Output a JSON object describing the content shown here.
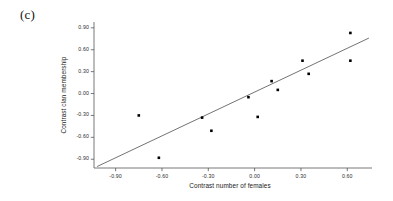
{
  "panel": {
    "label": "(c)"
  },
  "chart_data": {
    "type": "scatter",
    "title": "",
    "subtitle": "",
    "xlabel": "Contrast number of females",
    "ylabel": "Contrast clan membership",
    "xlim": [
      -1.04,
      0.76
    ],
    "ylim": [
      -1.02,
      0.98
    ],
    "xticks": [
      -0.9,
      -0.6,
      -0.3,
      0.0,
      0.3,
      0.6
    ],
    "xticklabels": [
      "-0.90",
      "-0.60",
      "-0.30",
      "0.00",
      "0.30",
      "0.60"
    ],
    "yticks": [
      -0.9,
      -0.6,
      -0.3,
      0.0,
      0.3,
      0.6,
      0.9
    ],
    "yticklabels": [
      "-0.90",
      "-0.60",
      "-0.30",
      "0.00",
      "0.30",
      "0.60",
      "0.90"
    ],
    "grid": false,
    "legend": null,
    "legend_position": "none",
    "marker": "filled-square",
    "marker_color": "#000000",
    "line_color": "#444444",
    "axis_color": "#555555",
    "points": [
      {
        "x": -0.75,
        "y": -0.3
      },
      {
        "x": -0.62,
        "y": -0.88
      },
      {
        "x": -0.34,
        "y": -0.33
      },
      {
        "x": -0.28,
        "y": -0.51
      },
      {
        "x": -0.04,
        "y": -0.05
      },
      {
        "x": 0.02,
        "y": -0.32
      },
      {
        "x": 0.11,
        "y": 0.17
      },
      {
        "x": 0.15,
        "y": 0.05
      },
      {
        "x": 0.31,
        "y": 0.45
      },
      {
        "x": 0.35,
        "y": 0.27
      },
      {
        "x": 0.62,
        "y": 0.83
      },
      {
        "x": 0.62,
        "y": 0.45
      }
    ],
    "fit_line": {
      "type": "linear-regression",
      "x_start": -1.02,
      "y_start": -1.0,
      "x_end": 0.74,
      "y_end": 0.76
    }
  }
}
